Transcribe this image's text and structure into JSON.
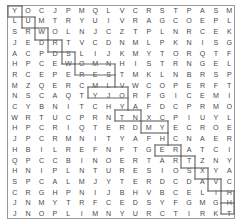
{
  "puzzle": {
    "type": "word-search",
    "columns": 17,
    "rows": 20,
    "border_color": "#9a9a9a",
    "letter_color": "#4a4a4a",
    "path_color": "#6b6b6b",
    "background": "#ffffff",
    "grid": [
      [
        "Y",
        "O",
        "C",
        "J",
        "P",
        "M",
        "Q",
        "L",
        "V",
        "C",
        "R",
        "S",
        "T",
        "P",
        "A",
        "S",
        "M"
      ],
      [
        "L",
        "U",
        "M",
        "T",
        "R",
        "Y",
        "U",
        "I",
        "V",
        "R",
        "A",
        "G",
        "C",
        "O",
        "E",
        "P",
        "L"
      ],
      [
        "S",
        "R",
        "W",
        "O",
        "L",
        "N",
        "J",
        "C",
        "Z",
        "T",
        "P",
        "L",
        "N",
        "R",
        "C",
        "E",
        "K"
      ],
      [
        "J",
        "E",
        "D",
        "R",
        "T",
        "V",
        "C",
        "D",
        "N",
        "M",
        "L",
        "P",
        "K",
        "N",
        "I",
        "S",
        "G"
      ],
      [
        "A",
        "C",
        "P",
        "D",
        "S",
        "L",
        "I",
        "J",
        "K",
        "M",
        "Y",
        "T",
        "O",
        "R",
        "Q",
        "T",
        "F"
      ],
      [
        "H",
        "P",
        "C",
        "E",
        "W",
        "O",
        "M",
        "N",
        "H",
        "I",
        "S",
        "T",
        "R",
        "N",
        "G",
        "E",
        "L"
      ],
      [
        "R",
        "C",
        "E",
        "P",
        "E",
        "R",
        "E",
        "S",
        "T",
        "M",
        "K",
        "L",
        "N",
        "B",
        "R",
        "S",
        "P"
      ],
      [
        "M",
        "Z",
        "Q",
        "E",
        "R",
        "C",
        "M",
        "L",
        "V",
        "W",
        "C",
        "O",
        "P",
        "E",
        "R",
        "F",
        "T"
      ],
      [
        "N",
        "S",
        "C",
        "A",
        "Q",
        "T",
        "Y",
        "J",
        "O",
        "R",
        "F",
        "G",
        "I",
        "C",
        "E",
        "M",
        "I"
      ],
      [
        "C",
        "Y",
        "B",
        "N",
        "I",
        "T",
        "C",
        "H",
        "Y",
        "A",
        "F",
        "D",
        "C",
        "P",
        "R",
        "M",
        "O"
      ],
      [
        "W",
        "R",
        "T",
        "U",
        "C",
        "P",
        "R",
        "N",
        "T",
        "N",
        "X",
        "C",
        "P",
        "I",
        "U",
        "Y",
        "L"
      ],
      [
        "H",
        "P",
        "C",
        "R",
        "I",
        "Q",
        "T",
        "E",
        "R",
        "D",
        "M",
        "Y",
        "E",
        "C",
        "R",
        "O",
        "E"
      ],
      [
        "J",
        "P",
        "C",
        "R",
        "M",
        "N",
        "I",
        "T",
        "Y",
        "A",
        "F",
        "H",
        "C",
        "N",
        "A",
        "E",
        "R"
      ],
      [
        "H",
        "B",
        "I",
        "L",
        "R",
        "E",
        "F",
        "N",
        "F",
        "T",
        "G",
        "E",
        "R",
        "A",
        "T",
        "C",
        "I"
      ],
      [
        "Q",
        "P",
        "C",
        "C",
        "B",
        "I",
        "N",
        "O",
        "E",
        "R",
        "T",
        "A",
        "R",
        "T",
        "Z",
        "N",
        "Y"
      ],
      [
        "H",
        "N",
        "I",
        "P",
        "L",
        "N",
        "T",
        "U",
        "R",
        "E",
        "S",
        "I",
        "O",
        "S",
        "X",
        "Y",
        "A"
      ],
      [
        "S",
        "P",
        "C",
        "A",
        "L",
        "M",
        "J",
        "Y",
        "T",
        "E",
        "R",
        "D",
        "C",
        "D",
        "A",
        "V",
        "C"
      ],
      [
        "C",
        "R",
        "G",
        "H",
        "P",
        "N",
        "I",
        "J",
        "B",
        "H",
        "V",
        "B",
        "C",
        "E",
        "L",
        "I",
        "H"
      ],
      [
        "J",
        "N",
        "M",
        "Y",
        "T",
        "R",
        "F",
        "C",
        "E",
        "D",
        "S",
        "Y",
        "F",
        "G",
        "M",
        "G",
        "H"
      ],
      [
        "J",
        "N",
        "O",
        "P",
        "L",
        "I",
        "M",
        "N",
        "Y",
        "U",
        "R",
        "C",
        "T",
        "I",
        "R",
        "K",
        "T"
      ]
    ],
    "path": {
      "description": "staircase outline descending from top-left to bottom-right",
      "segments": [
        {
          "x1": 8,
          "y1": 17,
          "x2": 8,
          "y2": 6
        },
        {
          "x1": 8,
          "y1": 6,
          "x2": 22,
          "y2": 6
        },
        {
          "x1": 22,
          "y1": 6,
          "x2": 22,
          "y2": 17
        },
        {
          "x1": 8,
          "y1": 17,
          "x2": 22,
          "y2": 17
        },
        {
          "x1": 22,
          "y1": 17,
          "x2": 22,
          "y2": 28
        },
        {
          "x1": 22,
          "y1": 28,
          "x2": 35,
          "y2": 28
        },
        {
          "x1": 35,
          "y1": 28,
          "x2": 35,
          "y2": 17
        },
        {
          "x1": 22,
          "y1": 17,
          "x2": 35,
          "y2": 17
        },
        {
          "x1": 35,
          "y1": 28,
          "x2": 35,
          "y2": 40
        },
        {
          "x1": 35,
          "y1": 40,
          "x2": 48,
          "y2": 40
        },
        {
          "x1": 48,
          "y1": 40,
          "x2": 48,
          "y2": 28
        },
        {
          "x1": 35,
          "y1": 28,
          "x2": 48,
          "y2": 28
        },
        {
          "x1": 48,
          "y1": 40,
          "x2": 48,
          "y2": 52
        },
        {
          "x1": 48,
          "y1": 52,
          "x2": 62,
          "y2": 52
        },
        {
          "x1": 62,
          "y1": 52,
          "x2": 62,
          "y2": 40
        },
        {
          "x1": 48,
          "y1": 40,
          "x2": 62,
          "y2": 40
        },
        {
          "x1": 62,
          "y1": 52,
          "x2": 62,
          "y2": 64
        },
        {
          "x1": 62,
          "y1": 64,
          "x2": 75,
          "y2": 64
        },
        {
          "x1": 75,
          "y1": 64,
          "x2": 75,
          "y2": 52
        },
        {
          "x1": 62,
          "y1": 52,
          "x2": 75,
          "y2": 52
        },
        {
          "x1": 75,
          "y1": 64,
          "x2": 75,
          "y2": 75
        },
        {
          "x1": 75,
          "y1": 75,
          "x2": 115,
          "y2": 75
        },
        {
          "x1": 115,
          "y1": 75,
          "x2": 115,
          "y2": 64
        },
        {
          "x1": 75,
          "y1": 64,
          "x2": 115,
          "y2": 64
        },
        {
          "x1": 115,
          "y1": 75,
          "x2": 115,
          "y2": 87
        },
        {
          "x1": 88,
          "y1": 87,
          "x2": 115,
          "y2": 87
        },
        {
          "x1": 88,
          "y1": 87,
          "x2": 88,
          "y2": 98
        },
        {
          "x1": 88,
          "y1": 98,
          "x2": 128,
          "y2": 98
        },
        {
          "x1": 128,
          "y1": 98,
          "x2": 128,
          "y2": 87
        },
        {
          "x1": 115,
          "y1": 87,
          "x2": 128,
          "y2": 87
        },
        {
          "x1": 128,
          "y1": 98,
          "x2": 128,
          "y2": 110
        },
        {
          "x1": 115,
          "y1": 110,
          "x2": 128,
          "y2": 110
        },
        {
          "x1": 115,
          "y1": 110,
          "x2": 115,
          "y2": 121
        },
        {
          "x1": 115,
          "y1": 121,
          "x2": 141,
          "y2": 121
        },
        {
          "x1": 141,
          "y1": 121,
          "x2": 141,
          "y2": 110
        },
        {
          "x1": 128,
          "y1": 110,
          "x2": 141,
          "y2": 110
        },
        {
          "x1": 141,
          "y1": 121,
          "x2": 141,
          "y2": 133
        },
        {
          "x1": 141,
          "y1": 133,
          "x2": 168,
          "y2": 133
        },
        {
          "x1": 168,
          "y1": 133,
          "x2": 168,
          "y2": 121
        },
        {
          "x1": 141,
          "y1": 121,
          "x2": 168,
          "y2": 121
        },
        {
          "x1": 168,
          "y1": 133,
          "x2": 168,
          "y2": 145
        },
        {
          "x1": 155,
          "y1": 145,
          "x2": 168,
          "y2": 145
        },
        {
          "x1": 155,
          "y1": 145,
          "x2": 155,
          "y2": 156
        },
        {
          "x1": 155,
          "y1": 156,
          "x2": 181,
          "y2": 156
        },
        {
          "x1": 181,
          "y1": 156,
          "x2": 181,
          "y2": 145
        },
        {
          "x1": 168,
          "y1": 145,
          "x2": 181,
          "y2": 145
        },
        {
          "x1": 181,
          "y1": 156,
          "x2": 181,
          "y2": 168
        },
        {
          "x1": 181,
          "y1": 168,
          "x2": 195,
          "y2": 168
        },
        {
          "x1": 195,
          "y1": 168,
          "x2": 195,
          "y2": 156
        },
        {
          "x1": 181,
          "y1": 156,
          "x2": 195,
          "y2": 156
        },
        {
          "x1": 195,
          "y1": 168,
          "x2": 195,
          "y2": 179
        },
        {
          "x1": 195,
          "y1": 179,
          "x2": 208,
          "y2": 179
        },
        {
          "x1": 208,
          "y1": 179,
          "x2": 208,
          "y2": 168
        },
        {
          "x1": 195,
          "y1": 168,
          "x2": 208,
          "y2": 168
        },
        {
          "x1": 208,
          "y1": 179,
          "x2": 208,
          "y2": 191
        },
        {
          "x1": 208,
          "y1": 191,
          "x2": 221,
          "y2": 191
        },
        {
          "x1": 221,
          "y1": 191,
          "x2": 221,
          "y2": 179
        },
        {
          "x1": 208,
          "y1": 179,
          "x2": 221,
          "y2": 179
        },
        {
          "x1": 221,
          "y1": 191,
          "x2": 221,
          "y2": 203
        },
        {
          "x1": 221,
          "y1": 203,
          "x2": 234,
          "y2": 203
        },
        {
          "x1": 234,
          "y1": 203,
          "x2": 234,
          "y2": 191
        },
        {
          "x1": 221,
          "y1": 191,
          "x2": 234,
          "y2": 191
        },
        {
          "x1": 234,
          "y1": 203,
          "x2": 234,
          "y2": 214
        },
        {
          "x1": 221,
          "y1": 214,
          "x2": 234,
          "y2": 214
        },
        {
          "x1": 221,
          "y1": 203,
          "x2": 221,
          "y2": 214
        }
      ]
    }
  }
}
